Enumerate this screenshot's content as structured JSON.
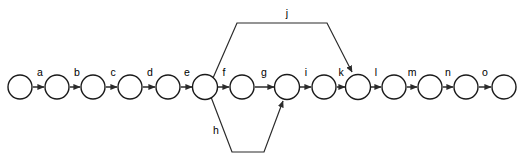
{
  "diagram": {
    "type": "directed-graph",
    "background_color": "#ffffff",
    "node_color": "#ffffff",
    "node_stroke_color": "#1a1a1a",
    "edge_color": "#2b2b2b",
    "label_color": "#000000",
    "node_radius": 12,
    "baseline_y": 87,
    "nodes": [
      {
        "id": "n1",
        "cx": 20,
        "cy": 87
      },
      {
        "id": "n2",
        "cx": 57,
        "cy": 87
      },
      {
        "id": "n3",
        "cx": 93,
        "cy": 87
      },
      {
        "id": "n4",
        "cx": 130,
        "cy": 87
      },
      {
        "id": "n5",
        "cx": 168,
        "cy": 87
      },
      {
        "id": "n6",
        "cx": 205,
        "cy": 87
      },
      {
        "id": "n7",
        "cx": 242,
        "cy": 87
      },
      {
        "id": "n8",
        "cx": 287,
        "cy": 87
      },
      {
        "id": "n9",
        "cx": 324,
        "cy": 87
      },
      {
        "id": "n10",
        "cx": 358,
        "cy": 87
      },
      {
        "id": "n11",
        "cx": 394,
        "cy": 87
      },
      {
        "id": "n12",
        "cx": 430,
        "cy": 87
      },
      {
        "id": "n13",
        "cx": 466,
        "cy": 87
      },
      {
        "id": "n14",
        "cx": 504,
        "cy": 87
      }
    ],
    "chain_edges": [
      {
        "label": "a",
        "from": "n1",
        "to": "n2",
        "label_x": 40,
        "label_y": 76
      },
      {
        "label": "b",
        "from": "n2",
        "to": "n3",
        "label_x": 77,
        "label_y": 76
      },
      {
        "label": "c",
        "from": "n3",
        "to": "n4",
        "label_x": 113,
        "label_y": 76
      },
      {
        "label": "d",
        "from": "n4",
        "to": "n5",
        "label_x": 150,
        "label_y": 76
      },
      {
        "label": "e",
        "from": "n5",
        "to": "n6",
        "label_x": 187,
        "label_y": 76
      },
      {
        "label": "f",
        "from": "n6",
        "to": "n7",
        "label_x": 224,
        "label_y": 76
      },
      {
        "label": "g",
        "from": "n7",
        "to": "n8",
        "label_x": 264,
        "label_y": 76
      },
      {
        "label": "i",
        "from": "n8",
        "to": "n9",
        "label_x": 306,
        "label_y": 76
      },
      {
        "label": "k",
        "from": "n9",
        "to": "n10",
        "label_x": 341,
        "label_y": 76
      },
      {
        "label": "l",
        "from": "n10",
        "to": "n11",
        "label_x": 376,
        "label_y": 76
      },
      {
        "label": "m",
        "from": "n11",
        "to": "n12",
        "label_x": 412,
        "label_y": 76
      },
      {
        "label": "n",
        "from": "n12",
        "to": "n13",
        "label_x": 448,
        "label_y": 76
      },
      {
        "label": "o",
        "from": "n13",
        "to": "n14",
        "label_x": 485,
        "label_y": 76
      }
    ],
    "branch_edges": [
      {
        "label": "j",
        "from": "n6",
        "to": "n10",
        "direction": "above",
        "path": "M 213 78 L 237 23 L 327 23 L 352 72",
        "label_x": 287,
        "label_y": 17
      },
      {
        "label": "h",
        "from": "n6",
        "to": "n8",
        "direction": "below",
        "path": "M 211 97 L 232 152 L 264 152 L 283 101",
        "label_x": 216,
        "label_y": 134
      }
    ]
  }
}
